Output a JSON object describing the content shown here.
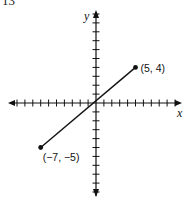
{
  "problem_number": "13",
  "chart_data": {
    "type": "line",
    "title": "",
    "xlabel": "x",
    "ylabel": "y",
    "xlim": [
      -11,
      11
    ],
    "ylim": [
      -11,
      11
    ],
    "grid": false,
    "series": [
      {
        "name": "segment",
        "points": [
          {
            "x": -7,
            "y": -5,
            "label": "(−7, −5)"
          },
          {
            "x": 5,
            "y": 4,
            "label": "(5, 4)"
          }
        ]
      }
    ],
    "tick_spacing": 1,
    "tick_labels": false
  },
  "labels": {
    "x_axis": "x",
    "y_axis": "y",
    "point_a": "(5, 4)",
    "point_b": "(−7, −5)"
  }
}
